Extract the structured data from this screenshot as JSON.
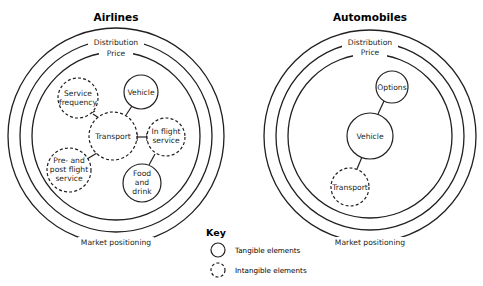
{
  "colors": {
    "ink": "#231f20",
    "background": "#ffffff"
  },
  "diagrams": [
    {
      "title": "Airlines",
      "rings": {
        "outer": "Distribution",
        "middle": "Price",
        "bottom": "Market positioning"
      },
      "nodes": [
        {
          "id": "service-frequency",
          "lines": [
            "Service",
            "frequency"
          ],
          "type": "intangible"
        },
        {
          "id": "vehicle",
          "lines": [
            "Vehicle"
          ],
          "type": "tangible"
        },
        {
          "id": "transport",
          "lines": [
            "Transport"
          ],
          "type": "intangible"
        },
        {
          "id": "in-flight-service",
          "lines": [
            "In flight",
            "service"
          ],
          "type": "intangible"
        },
        {
          "id": "pre-post-flight-service",
          "lines": [
            "Pre- and",
            "post flight",
            "service"
          ],
          "type": "intangible"
        },
        {
          "id": "food-and-drink",
          "lines": [
            "Food",
            "and",
            "drink"
          ],
          "type": "tangible"
        }
      ],
      "links": [
        [
          "transport",
          "service-frequency"
        ],
        [
          "transport",
          "vehicle"
        ],
        [
          "transport",
          "in-flight-service"
        ],
        [
          "transport",
          "pre-post-flight-service"
        ],
        [
          "in-flight-service",
          "food-and-drink"
        ]
      ]
    },
    {
      "title": "Automobiles",
      "rings": {
        "outer": "Distribution",
        "middle": "Price",
        "bottom": "Market positioning"
      },
      "nodes": [
        {
          "id": "options",
          "lines": [
            "Options"
          ],
          "type": "tangible"
        },
        {
          "id": "vehicle",
          "lines": [
            "Vehicle"
          ],
          "type": "tangible"
        },
        {
          "id": "transport",
          "lines": [
            "Transport"
          ],
          "type": "intangible"
        }
      ],
      "links": [
        [
          "vehicle",
          "options"
        ],
        [
          "vehicle",
          "transport"
        ]
      ]
    }
  ],
  "key": {
    "title": "Key",
    "items": [
      {
        "label": "Tangible elements",
        "style": "solid"
      },
      {
        "label": "Intangible elements",
        "style": "dashed"
      }
    ]
  }
}
